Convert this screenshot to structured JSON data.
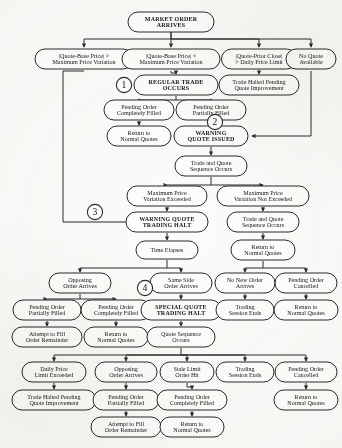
{
  "style": {
    "stroke": "#2b2b2b",
    "fill": "#fdfdfb",
    "text": "#161616"
  },
  "markers": [
    {
      "id": "m1",
      "label": "1",
      "cx": 124,
      "cy": 85
    },
    {
      "id": "m2",
      "label": "2",
      "cx": 215,
      "cy": 122
    },
    {
      "id": "m3",
      "label": "3",
      "cx": 95,
      "cy": 212
    },
    {
      "id": "m4",
      "label": "4",
      "cx": 145,
      "cy": 288
    }
  ],
  "nodes": [
    {
      "id": "n1",
      "lines": [
        "MARKET ORDER",
        "ARRIVES"
      ],
      "bold": true,
      "cx": 171,
      "cy": 22,
      "w": 86,
      "h": 20
    },
    {
      "id": "n2",
      "lines": [
        "|Quote-Base Price| >",
        "Maximum Price Variation"
      ],
      "bold": false,
      "cx": 84,
      "cy": 59,
      "w": 98,
      "h": 20
    },
    {
      "id": "n3",
      "lines": [
        "|Quote-Base Price| <",
        "Maximum Price Variation"
      ],
      "bold": false,
      "cx": 171,
      "cy": 59,
      "w": 98,
      "h": 20
    },
    {
      "id": "n4",
      "lines": [
        "|Quote-Prior Close|",
        "> Daily Price Limit"
      ],
      "bold": false,
      "cx": 259,
      "cy": 59,
      "w": 75,
      "h": 20
    },
    {
      "id": "n5",
      "lines": [
        "No Quote",
        "Available"
      ],
      "bold": false,
      "cx": 311,
      "cy": 59,
      "w": 50,
      "h": 20
    },
    {
      "id": "n6",
      "lines": [
        "REGULAR TRADE",
        "OCCURS"
      ],
      "bold": true,
      "cx": 176,
      "cy": 85,
      "w": 84,
      "h": 20
    },
    {
      "id": "n7",
      "lines": [
        "Trade Halted Pending",
        "Quote Improvement"
      ],
      "bold": false,
      "cx": 259,
      "cy": 85,
      "w": 80,
      "h": 20
    },
    {
      "id": "n8",
      "lines": [
        "Pending Order",
        "Completely Filled"
      ],
      "bold": false,
      "cx": 139,
      "cy": 110,
      "w": 70,
      "h": 20
    },
    {
      "id": "n9",
      "lines": [
        "Pending Order",
        "Partially Filled"
      ],
      "bold": false,
      "cx": 211,
      "cy": 110,
      "w": 70,
      "h": 20
    },
    {
      "id": "n10",
      "lines": [
        "Return to",
        "Normal Quotes"
      ],
      "bold": false,
      "cx": 139,
      "cy": 136,
      "w": 64,
      "h": 20
    },
    {
      "id": "n11",
      "lines": [
        "WARNING",
        "QUOTE ISSUED"
      ],
      "bold": true,
      "cx": 211,
      "cy": 136,
      "w": 74,
      "h": 20
    },
    {
      "id": "n12",
      "lines": [
        "Trade and Quote",
        "Sequence Occurs"
      ],
      "bold": false,
      "cx": 211,
      "cy": 166,
      "w": 72,
      "h": 20
    },
    {
      "id": "n13",
      "lines": [
        "Maximum Price",
        "Variation Exceeded"
      ],
      "bold": false,
      "cx": 167,
      "cy": 196,
      "w": 80,
      "h": 20
    },
    {
      "id": "n14",
      "lines": [
        "Maximum Price",
        "Variation Not Exceeded"
      ],
      "bold": false,
      "cx": 263,
      "cy": 196,
      "w": 92,
      "h": 20
    },
    {
      "id": "n15",
      "lines": [
        "WARNING QUOTE",
        "TRADING HALT"
      ],
      "bold": true,
      "cx": 167,
      "cy": 222,
      "w": 82,
      "h": 20
    },
    {
      "id": "n16",
      "lines": [
        "Trade and Quote",
        "Sequence Occurs"
      ],
      "bold": false,
      "cx": 263,
      "cy": 222,
      "w": 72,
      "h": 20
    },
    {
      "id": "n17",
      "lines": [
        "Time Elapses"
      ],
      "bold": false,
      "cx": 167,
      "cy": 250,
      "w": 62,
      "h": 18
    },
    {
      "id": "n18",
      "lines": [
        "Return to",
        "Normal Quotes"
      ],
      "bold": false,
      "cx": 263,
      "cy": 250,
      "w": 64,
      "h": 20
    },
    {
      "id": "n19",
      "lines": [
        "Opposing",
        "Order Arrives"
      ],
      "bold": false,
      "cx": 80,
      "cy": 283,
      "w": 62,
      "h": 20
    },
    {
      "id": "n20",
      "lines": [
        "Same Side",
        "Order Arrives"
      ],
      "bold": false,
      "cx": 181,
      "cy": 283,
      "w": 62,
      "h": 20
    },
    {
      "id": "n21",
      "lines": [
        "No New Order",
        "Arrives"
      ],
      "bold": false,
      "cx": 245,
      "cy": 283,
      "w": 60,
      "h": 20
    },
    {
      "id": "n22",
      "lines": [
        "Pending Order",
        "Cancelled"
      ],
      "bold": false,
      "cx": 306,
      "cy": 283,
      "w": 62,
      "h": 20
    },
    {
      "id": "n23",
      "lines": [
        "Pending Order",
        "Partially Filled"
      ],
      "bold": false,
      "cx": 47,
      "cy": 310,
      "w": 68,
      "h": 20
    },
    {
      "id": "n24",
      "lines": [
        "Pending Order",
        "Completely Filled"
      ],
      "bold": false,
      "cx": 116,
      "cy": 310,
      "w": 70,
      "h": 20
    },
    {
      "id": "n25",
      "lines": [
        "SPECIAL QUOTE",
        "TRADING HALT"
      ],
      "bold": true,
      "cx": 181,
      "cy": 310,
      "w": 80,
      "h": 20
    },
    {
      "id": "n26",
      "lines": [
        "Trading",
        "Session Ends"
      ],
      "bold": false,
      "cx": 245,
      "cy": 310,
      "w": 58,
      "h": 20
    },
    {
      "id": "n27",
      "lines": [
        "Return to",
        "Normal Quotes"
      ],
      "bold": false,
      "cx": 306,
      "cy": 310,
      "w": 64,
      "h": 20
    },
    {
      "id": "n28",
      "lines": [
        "Attempt to Fill",
        "Order Remainder"
      ],
      "bold": false,
      "cx": 47,
      "cy": 337,
      "w": 70,
      "h": 20
    },
    {
      "id": "n29",
      "lines": [
        "Return to",
        "Normal Quotes"
      ],
      "bold": false,
      "cx": 116,
      "cy": 337,
      "w": 64,
      "h": 20
    },
    {
      "id": "n30",
      "lines": [
        "Quote Sequence",
        "Occurs"
      ],
      "bold": false,
      "cx": 181,
      "cy": 337,
      "w": 68,
      "h": 20
    },
    {
      "id": "n31",
      "lines": [
        "Daily Price",
        "Limit Exceeded"
      ],
      "bold": false,
      "cx": 54,
      "cy": 372,
      "w": 64,
      "h": 20
    },
    {
      "id": "n32",
      "lines": [
        "Opposing",
        "Order Arrives"
      ],
      "bold": false,
      "cx": 126,
      "cy": 372,
      "w": 62,
      "h": 20
    },
    {
      "id": "n33",
      "lines": [
        "Stale Limit",
        "Order Hit"
      ],
      "bold": false,
      "cx": 187,
      "cy": 372,
      "w": 54,
      "h": 20
    },
    {
      "id": "n34",
      "lines": [
        "Trading",
        "Session Ends"
      ],
      "bold": false,
      "cx": 245,
      "cy": 372,
      "w": 58,
      "h": 20
    },
    {
      "id": "n35",
      "lines": [
        "Pending Order",
        "Cancelled"
      ],
      "bold": false,
      "cx": 306,
      "cy": 372,
      "w": 62,
      "h": 20
    },
    {
      "id": "n36",
      "lines": [
        "Trade Halted Pending",
        "Quote Improvement"
      ],
      "bold": false,
      "cx": 54,
      "cy": 400,
      "w": 84,
      "h": 20
    },
    {
      "id": "n37",
      "lines": [
        "Pending Order",
        "Partially Filled"
      ],
      "bold": false,
      "cx": 126,
      "cy": 400,
      "w": 66,
      "h": 20
    },
    {
      "id": "n38",
      "lines": [
        "Pending Order",
        "Completely Filled"
      ],
      "bold": false,
      "cx": 192,
      "cy": 400,
      "w": 70,
      "h": 20
    },
    {
      "id": "n39",
      "lines": [
        "Return to",
        "Normal Quotes"
      ],
      "bold": false,
      "cx": 306,
      "cy": 400,
      "w": 64,
      "h": 20
    },
    {
      "id": "n40",
      "lines": [
        "Attempt to Fill",
        "Order Remainder"
      ],
      "bold": false,
      "cx": 126,
      "cy": 427,
      "w": 70,
      "h": 20
    },
    {
      "id": "n41",
      "lines": [
        "Return to",
        "Normal Quotes"
      ],
      "bold": false,
      "cx": 192,
      "cy": 427,
      "w": 64,
      "h": 20
    }
  ],
  "edges": [
    {
      "from": "n1",
      "to": "n2",
      "d": "M171 32 L171 39 L84 39 L84 47"
    },
    {
      "from": "n1",
      "to": "n3",
      "d": "M171 32 L171 47"
    },
    {
      "from": "n1",
      "to": "n4",
      "d": "M171 39 L259 39 L259 47"
    },
    {
      "from": "n1",
      "to": "n5",
      "d": "M171 39 L311 39 L311 47"
    },
    {
      "from": "n3",
      "to": "n6",
      "d": "M171 71 L171 73 L176 73 L176 74"
    },
    {
      "from": "n4",
      "to": "n7",
      "d": "M259 71 L259 74"
    },
    {
      "from": "n6",
      "to": "n8",
      "d": "M176 96 L176 100 L139 100 L139 99"
    },
    {
      "from": "n6",
      "to": "n9",
      "d": "M176 100 L211 100 L211 99"
    },
    {
      "from": "n8",
      "to": "n10",
      "d": "M139 121 L139 125"
    },
    {
      "from": "n9",
      "to": "n11",
      "d": "M211 121 L211 125"
    },
    {
      "from": "n2",
      "to": "n15",
      "d": "M84 71 L63 71 L63 222 L153 222"
    },
    {
      "from": "n5",
      "to": "n11",
      "d": "M311 71 L311 136 L252 136"
    },
    {
      "from": "n11",
      "to": "n12",
      "d": "M211 147 L211 155"
    },
    {
      "from": "n12",
      "to": "n13",
      "d": "M211 177 L211 185 L167 185 L167 185"
    },
    {
      "from": "n12",
      "to": "n14",
      "d": "M211 185 L263 185 L263 185"
    },
    {
      "from": "n13",
      "to": "n15",
      "d": "M167 207 L167 211"
    },
    {
      "from": "n14",
      "to": "n16",
      "d": "M263 207 L263 211"
    },
    {
      "from": "n15",
      "to": "n17",
      "d": "M167 233 L167 240"
    },
    {
      "from": "n16",
      "to": "n18",
      "d": "M263 233 L263 239"
    },
    {
      "from": "n17",
      "to": "n19",
      "d": "M167 260 L167 268 L80 268 L80 272"
    },
    {
      "from": "n17",
      "to": "n20",
      "d": "M167 268 L181 268 L181 272"
    },
    {
      "from": "n18",
      "to": "n21",
      "d": "M263 261 L263 268 L245 268 L245 272"
    },
    {
      "from": "n18",
      "to": "n22",
      "d": "M263 268 L306 268 L306 272"
    },
    {
      "from": "n19",
      "to": "n23",
      "d": "M80 294 L80 299 L47 299 L47 299"
    },
    {
      "from": "n19",
      "to": "n24",
      "d": "M80 299 L116 299 L116 299"
    },
    {
      "from": "n20",
      "to": "n25",
      "d": "M181 294 L181 299"
    },
    {
      "from": "n21",
      "to": "n26",
      "d": "M245 294 L245 299"
    },
    {
      "from": "n22",
      "to": "n27",
      "d": "M306 294 L306 299"
    },
    {
      "from": "n23",
      "to": "n28",
      "d": "M47 321 L47 326"
    },
    {
      "from": "n24",
      "to": "n29",
      "d": "M116 321 L116 326"
    },
    {
      "from": "n25",
      "to": "n30",
      "d": "M181 321 L181 326"
    },
    {
      "from": "n30",
      "to": "n31",
      "d": "M181 348 L181 355 L54 355 L54 361"
    },
    {
      "from": "n30",
      "to": "n32",
      "d": "M181 355 L126 355 L126 361"
    },
    {
      "from": "n30",
      "to": "n33",
      "d": "M181 355 L187 355 L187 361"
    },
    {
      "from": "n30",
      "to": "n34",
      "d": "M181 355 L245 355 L245 361"
    },
    {
      "from": "n30",
      "to": "n35",
      "d": "M181 355 L306 355 L306 361"
    },
    {
      "from": "n31",
      "to": "n36",
      "d": "M54 383 L54 389"
    },
    {
      "from": "n32",
      "to": "n37",
      "d": "M126 383 L126 389"
    },
    {
      "from": "n33",
      "to": "n38",
      "d": "M187 383 L187 387 L192 387 L192 389"
    },
    {
      "from": "n35",
      "to": "n39",
      "d": "M306 383 L306 389"
    },
    {
      "from": "n37",
      "to": "n40",
      "d": "M126 411 L126 416"
    },
    {
      "from": "n38",
      "to": "n41",
      "d": "M192 411 L192 416"
    }
  ]
}
